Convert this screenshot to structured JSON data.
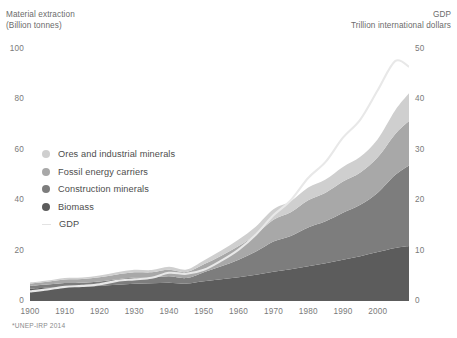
{
  "left_axis": {
    "title": "Material extraction\n(Billion tonnes)",
    "ticks": [
      "100",
      "80",
      "60",
      "40",
      "20",
      "0"
    ]
  },
  "right_axis": {
    "title": "GDP\nTrillion international dollars",
    "ticks": [
      "50",
      "40",
      "30",
      "20",
      "10",
      "0"
    ]
  },
  "x_axis": {
    "ticks": [
      "1900",
      "1910",
      "1920",
      "1930",
      "1940",
      "1950",
      "1960",
      "1970",
      "1980",
      "1990",
      "2000"
    ]
  },
  "legend": {
    "items": [
      {
        "label": "Ores and industrial minerals",
        "color": "#cfcfcf",
        "marker": "dot"
      },
      {
        "label": "Fossil energy carriers",
        "color": "#a8a8a8",
        "marker": "dot"
      },
      {
        "label": "Construction minerals",
        "color": "#7d7d7d",
        "marker": "dot"
      },
      {
        "label": "Biomass",
        "color": "#5c5c5c",
        "marker": "dot"
      },
      {
        "label": "GDP",
        "color": "#e3e3e3",
        "marker": "line"
      }
    ]
  },
  "footnote": "*UNEP-IRP 2014",
  "colors": {
    "background": "#ffffff",
    "ores": "#cfcfcf",
    "fossil": "#a8a8a8",
    "construction": "#7d7d7d",
    "biomass": "#5c5c5c",
    "gdp_line": "#e8e8e8",
    "text": "#6b6b6b"
  },
  "chart_data": {
    "type": "area",
    "title": "",
    "subtitle": "",
    "xlabel": "",
    "ylabel": "Material extraction (Billion tonnes)",
    "y2label": "GDP Trillion international dollars",
    "xlim": [
      1900,
      2009
    ],
    "ylim": [
      0,
      100
    ],
    "y2lim": [
      0,
      50
    ],
    "grid": false,
    "legend_position": "inside-left",
    "stacked": true,
    "stack_order_bottom_to_top": [
      "Biomass",
      "Construction minerals",
      "Fossil energy carriers",
      "Ores and industrial minerals"
    ],
    "x": [
      1900,
      1905,
      1910,
      1915,
      1920,
      1925,
      1930,
      1935,
      1940,
      1945,
      1950,
      1955,
      1960,
      1965,
      1970,
      1975,
      1980,
      1985,
      1990,
      1995,
      2000,
      2005,
      2009
    ],
    "series": [
      {
        "name": "Biomass",
        "axis": "left",
        "color": "#5c5c5c",
        "values": [
          5.0,
          5.3,
          5.6,
          5.8,
          6.0,
          6.4,
          6.8,
          7.0,
          7.2,
          6.9,
          7.8,
          8.6,
          9.4,
          10.4,
          11.6,
          12.6,
          13.8,
          15.0,
          16.4,
          17.8,
          19.4,
          21.0,
          21.8
        ]
      },
      {
        "name": "Construction minerals",
        "axis": "left",
        "color": "#7d7d7d",
        "values": [
          1.0,
          1.2,
          1.5,
          1.4,
          1.7,
          2.2,
          2.5,
          2.3,
          2.6,
          2.2,
          3.6,
          5.2,
          7.0,
          9.2,
          12.0,
          13.2,
          15.4,
          16.6,
          18.6,
          20.4,
          23.6,
          29.0,
          32.0
        ]
      },
      {
        "name": "Fossil energy carriers",
        "axis": "left",
        "color": "#a8a8a8",
        "values": [
          0.9,
          1.1,
          1.4,
          1.5,
          1.7,
          1.9,
          2.1,
          2.1,
          2.6,
          2.4,
          3.2,
          4.2,
          5.4,
          6.8,
          8.6,
          9.4,
          10.8,
          11.4,
          12.4,
          12.8,
          14.0,
          16.2,
          17.6
        ]
      },
      {
        "name": "Ores and industrial minerals",
        "axis": "left",
        "color": "#cfcfcf",
        "values": [
          0.4,
          0.5,
          0.6,
          0.6,
          0.7,
          0.9,
          1.0,
          0.9,
          1.2,
          1.0,
          1.5,
          2.0,
          2.6,
          3.2,
          4.2,
          4.4,
          5.0,
          5.2,
          5.8,
          6.2,
          7.2,
          9.4,
          11.0
        ]
      },
      {
        "name": "GDP",
        "axis": "right",
        "color": "#e8e8e8",
        "type": "line",
        "values": [
          1.9,
          2.3,
          2.8,
          3.0,
          3.3,
          4.0,
          4.3,
          4.6,
          5.6,
          5.4,
          6.2,
          8.0,
          10.2,
          13.2,
          17.0,
          20.0,
          24.4,
          27.6,
          32.4,
          36.0,
          41.8,
          47.6,
          46.5
        ]
      }
    ],
    "total_material_extraction": [
      7.3,
      8.1,
      9.1,
      9.3,
      10.1,
      11.4,
      12.4,
      12.3,
      13.6,
      12.5,
      16.1,
      20.0,
      24.4,
      29.6,
      36.4,
      39.6,
      45.0,
      48.2,
      53.2,
      57.2,
      64.2,
      75.6,
      82.4
    ]
  }
}
